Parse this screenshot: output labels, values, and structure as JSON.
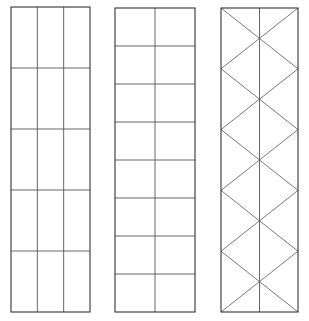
{
  "diagram": {
    "type": "grid-patterns",
    "line_color": "#555555",
    "outline_color": "#333333",
    "panels": [
      {
        "name": "left-panel",
        "pattern": "3 columns x 5 rows rectangular grid",
        "x": 11,
        "y": 7,
        "width": 79,
        "height": 305,
        "columns": 3,
        "rows": 5,
        "diagonals": false
      },
      {
        "name": "middle-panel",
        "pattern": "2 columns x 8 rows square grid",
        "x": 115,
        "y": 8,
        "width": 80,
        "height": 304,
        "columns": 2,
        "rows": 8,
        "diagonals": false
      },
      {
        "name": "right-panel",
        "pattern": "center line with zigzag diamond lattice",
        "x": 221,
        "y": 8,
        "width": 77,
        "height": 304,
        "columns": 2,
        "rows": 5,
        "diagonals": true
      }
    ]
  }
}
